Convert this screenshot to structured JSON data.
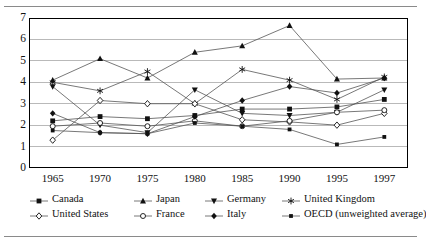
{
  "figure": {
    "has_top_rule": true,
    "has_bottom_rule": true
  },
  "chart_data": {
    "type": "line",
    "title": "",
    "subtitle": "",
    "xlabel": "",
    "ylabel": "",
    "x": [
      "1965",
      "1970",
      "1975",
      "1980",
      "1985",
      "1990",
      "1995",
      "1997"
    ],
    "xtick_labels": [
      "1965",
      "1970",
      "1975",
      "1980",
      "1985",
      "1990",
      "1995",
      "1997"
    ],
    "ytick_labels": [
      "0",
      "1",
      "2",
      "3",
      "4",
      "5",
      "6",
      "7"
    ],
    "ylim": [
      0,
      7
    ],
    "yticks": [
      0,
      1,
      2,
      3,
      4,
      5,
      6,
      7
    ],
    "grid": "horizontal",
    "grid_color": "#b9b9b9",
    "legend_position": "bottom",
    "line_color": "#555555",
    "series": [
      {
        "name": "Canada",
        "marker": "filled-square",
        "values": [
          2.2,
          2.4,
          2.3,
          2.45,
          2.75,
          2.75,
          2.85,
          3.2
        ]
      },
      {
        "name": "Japan",
        "marker": "filled-triangle",
        "values": [
          4.1,
          5.1,
          4.2,
          5.4,
          5.7,
          6.65,
          4.15,
          4.2
        ]
      },
      {
        "name": "Germany",
        "marker": "filled-down-triangle",
        "values": [
          3.8,
          2.0,
          1.65,
          3.65,
          2.55,
          2.45,
          2.6,
          3.65
        ]
      },
      {
        "name": "United Kingdom",
        "marker": "open-star",
        "values": [
          4.0,
          3.6,
          4.5,
          3.0,
          4.6,
          4.1,
          3.2,
          4.25
        ]
      },
      {
        "name": "United States",
        "marker": "open-diamond",
        "values": [
          1.3,
          3.15,
          3.0,
          3.0,
          2.25,
          2.15,
          2.0,
          2.55
        ]
      },
      {
        "name": "France",
        "marker": "open-circle",
        "values": [
          1.95,
          2.1,
          1.95,
          2.2,
          1.95,
          2.2,
          2.6,
          2.7
        ]
      },
      {
        "name": "Italy",
        "marker": "filled-diamond",
        "values": [
          2.55,
          1.65,
          1.6,
          2.4,
          3.15,
          3.8,
          3.5,
          4.2
        ]
      },
      {
        "name": "OECD (unweighted average)",
        "marker": "small-filled-square",
        "values": [
          1.75,
          1.65,
          1.6,
          2.1,
          1.95,
          1.8,
          1.1,
          1.45
        ]
      }
    ]
  }
}
